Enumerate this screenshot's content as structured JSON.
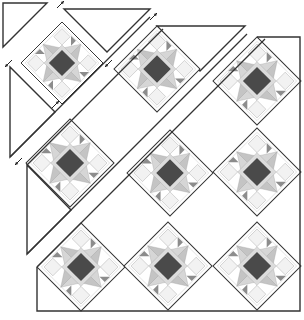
{
  "diagram": {
    "colors": {
      "line": "#333333",
      "dark": "#4a4a4a",
      "medium": "#8c8c8c",
      "light": "#cdcdcd",
      "pale": "#e8e8e8",
      "background": "#ffffff"
    },
    "block_half_diagonal": 43,
    "blocks": [
      {
        "id": 1,
        "strip": "A",
        "cx": 62,
        "cy": 63,
        "h": 41
      },
      {
        "id": 2,
        "strip": "B",
        "cx": 157,
        "cy": 69,
        "h": 43
      },
      {
        "id": 3,
        "strip": "C",
        "cx": 257,
        "cy": 81,
        "h": 44
      },
      {
        "id": 4,
        "strip": "B",
        "cx": 70,
        "cy": 163,
        "h": 44
      },
      {
        "id": 5,
        "strip": "C",
        "cx": 170,
        "cy": 173,
        "h": 43
      },
      {
        "id": 6,
        "strip": "D",
        "cx": 257,
        "cy": 172,
        "h": 44
      },
      {
        "id": 7,
        "strip": "C",
        "cx": 81,
        "cy": 267,
        "h": 44
      },
      {
        "id": 8,
        "strip": "D",
        "cx": 168,
        "cy": 266,
        "h": 44
      },
      {
        "id": 9,
        "strip": "E",
        "cx": 257,
        "cy": 266,
        "h": 44
      }
    ],
    "setting_pieces": [
      {
        "name": "corner-triangle-top-left",
        "points": "3,3 47,3 3,47"
      },
      {
        "name": "setting-triangle-a-top",
        "points": "64,9 150,9 107,52"
      },
      {
        "name": "setting-triangle-a-left",
        "points": "10,67 10,157 55,112"
      },
      {
        "name": "setting-triangle-b-top",
        "points": "157,26 245,26 200,71"
      },
      {
        "name": "setting-triangle-b-left",
        "points": "27,165 27,254 71,210"
      }
    ],
    "frame": {
      "points": "257,37 300,37 300,311 37,311 37,267"
    },
    "arrows": [
      {
        "x1": 57,
        "y1": 8,
        "x2": 64,
        "y2": 1
      },
      {
        "x1": 12,
        "y1": 60,
        "x2": 5,
        "y2": 67
      },
      {
        "x1": 112,
        "y1": 60,
        "x2": 105,
        "y2": 67
      },
      {
        "x1": 52,
        "y1": 108,
        "x2": 59,
        "y2": 101
      },
      {
        "x1": 150,
        "y1": 20,
        "x2": 157,
        "y2": 13
      },
      {
        "x1": 22,
        "y1": 158,
        "x2": 15,
        "y2": 165
      }
    ]
  }
}
